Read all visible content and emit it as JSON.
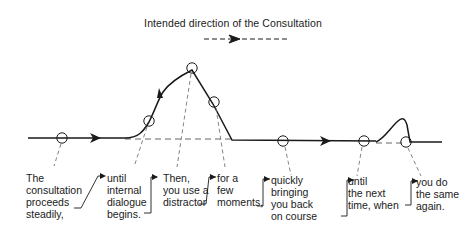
{
  "title": "Intended direction of the Consultation",
  "legend": {
    "symbol": "dashed-arrow",
    "meaning": "intended direction"
  },
  "colors": {
    "ink": "#1a1a1a",
    "background": "#ffffff"
  },
  "stages": [
    {
      "id": "steady",
      "text": "The\nconsultation\nproceeds\nsteadily,"
    },
    {
      "id": "internal-dialogue",
      "text": "until\ninternal\ndialogue\nbegins."
    },
    {
      "id": "distractor",
      "text": "Then,\nyou use a\ndistractor"
    },
    {
      "id": "few-moments",
      "text": "for a\nfew\nmoments,"
    },
    {
      "id": "back-on-course",
      "text": "quickly\nbringing\nyou back\non course"
    },
    {
      "id": "next-time",
      "text": "until\nthe next\ntime, when"
    },
    {
      "id": "same-again",
      "text": "you do\nthe same\nagain."
    }
  ]
}
